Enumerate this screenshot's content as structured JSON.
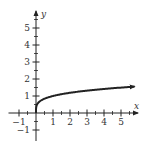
{
  "chart_data": {
    "type": "line",
    "title": "",
    "xlabel": "x",
    "ylabel": "y",
    "xlim": [
      -1.5,
      6
    ],
    "ylim": [
      -1.6,
      6
    ],
    "x_ticks": [
      -1,
      1,
      2,
      3,
      4,
      5
    ],
    "x_tick_labels": [
      "-1",
      "1",
      "2",
      "3",
      "4",
      "5"
    ],
    "y_ticks": [
      -1,
      1,
      2,
      3,
      4,
      5
    ],
    "y_tick_labels": [
      "-1",
      "1",
      "2",
      "3",
      "4",
      "5"
    ],
    "minor_ticks": "half-units",
    "grid": false,
    "legend": "none",
    "series": [
      {
        "name": "y = x^(1/4)",
        "function": "x^(1/4)",
        "domain": [
          0,
          5.8
        ],
        "x": [
          0,
          0.01,
          0.1,
          0.25,
          0.5,
          1,
          1.5,
          2,
          2.5,
          3,
          3.5,
          4,
          4.5,
          5,
          5.5,
          5.8
        ],
        "values": [
          0,
          0.32,
          0.56,
          0.71,
          0.84,
          1.0,
          1.11,
          1.19,
          1.26,
          1.32,
          1.37,
          1.41,
          1.46,
          1.5,
          1.53,
          1.55
        ],
        "end_arrow": true,
        "color": "#222222"
      }
    ]
  }
}
